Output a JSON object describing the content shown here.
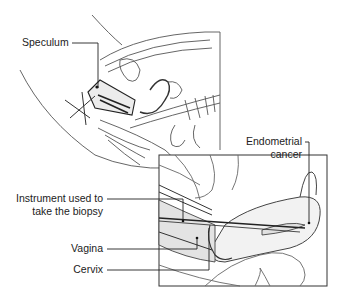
{
  "figure": {
    "colors": {
      "line": "#444444",
      "fill_tissue": "#e6e6e6",
      "background": "#ffffff",
      "leader": "#222222"
    },
    "labels": [
      {
        "id": "speculum",
        "lines": [
          "Speculum"
        ]
      },
      {
        "id": "endometrial-cancer",
        "lines": [
          "Endometrial",
          "cancer"
        ]
      },
      {
        "id": "instrument",
        "lines": [
          "Instrument used to",
          "take the biopsy"
        ]
      },
      {
        "id": "vagina",
        "lines": [
          "Vagina"
        ]
      },
      {
        "id": "cervix",
        "lines": [
          "Cervix"
        ]
      }
    ],
    "inset": {
      "x": 159,
      "y": 155,
      "width": 168,
      "height": 131
    }
  }
}
